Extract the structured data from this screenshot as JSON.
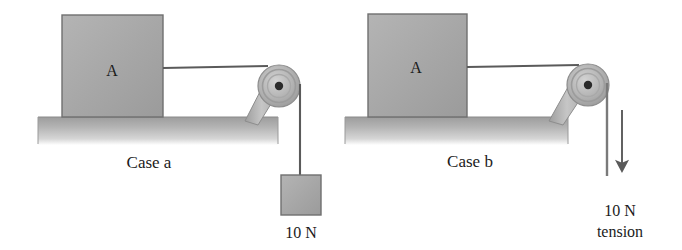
{
  "figure": {
    "background_color": "#ffffff",
    "ink_color": "#1b1b1b",
    "block_fill": "#a8a8a8",
    "block_stroke": "#6d6d6d",
    "table_fill": "#b0b0b0",
    "pulley_fill": "#b5b5b5",
    "pulley_stroke": "#7a7a7a",
    "rope_color": "#555555"
  },
  "cases": [
    {
      "id": "case-a",
      "label": "Case a",
      "block_label": "A",
      "load_type": "hanging-weight",
      "force_label": "10 N",
      "force_label_line2": "",
      "has_arrow": false
    },
    {
      "id": "case-b",
      "label": "Case b",
      "block_label": "A",
      "load_type": "applied-tension",
      "force_label": "10 N",
      "force_label_line2": "tension",
      "has_arrow": true
    }
  ]
}
